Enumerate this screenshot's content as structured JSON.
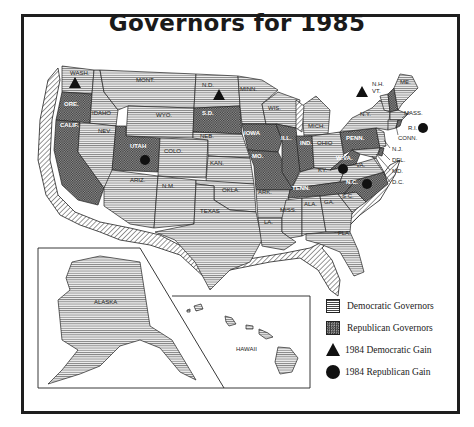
{
  "title": "Governors for 1985",
  "colors": {
    "ink": "#1a1a1a",
    "democratic_fill": "#e8e8e8",
    "republican_fill": "#8a8a8a",
    "coast_hatch": "#555555"
  },
  "states": {
    "wash": "WASH.",
    "ore": "ORE.",
    "calif": "CALIF.",
    "idaho": "IDAHO",
    "nev": "NEV.",
    "mont": "MONT.",
    "wyo": "WYO.",
    "utah": "UTAH",
    "colo": "COLO.",
    "ariz": "ARIZ.",
    "nm": "N.M.",
    "nd": "N.D.",
    "sd": "S.D.",
    "neb": "NEB.",
    "kan": "KAN.",
    "okla": "OKLA.",
    "texas": "TEXAS",
    "minn": "MINN.",
    "iowa": "IOWA",
    "mo": "MO.",
    "ark": "ARK.",
    "la": "LA.",
    "wis": "WIS.",
    "ill": "ILL.",
    "mich": "MICH.",
    "ind": "IND.",
    "ohio": "OHIO",
    "ky": "KY.",
    "tenn": "TENN.",
    "miss": "MISS.",
    "ala": "ALA.",
    "ga": "GA.",
    "fla": "FLA.",
    "sc": "S.C.",
    "nc": "N.C.",
    "va": "VA.",
    "wva": "W.VA.",
    "penn": "PENN.",
    "ny": "N.Y.",
    "vt": "VT.",
    "nh": "N.H.",
    "me": "ME.",
    "mass": "MASS.",
    "ri": "R.I.",
    "conn": "CONN.",
    "nj": "N.J.",
    "del": "DEL.",
    "md": "MD.",
    "dc": "D.C.",
    "alaska": "ALASKA",
    "hawaii": "HAWAII"
  },
  "governor_party": {
    "democratic": [
      "WASH.",
      "CALIF. (hatched coast)",
      "IDAHO",
      "NEV.",
      "MONT.",
      "WYO.",
      "COLO.",
      "ARIZ.",
      "N.M.",
      "N.D.",
      "NEB.",
      "KAN.",
      "OKLA.",
      "TEXAS",
      "MINN.",
      "ARK.",
      "LA.",
      "WIS.",
      "MICH.",
      "OHIO",
      "KY.",
      "MISS.",
      "ALA.",
      "GA.",
      "FLA.",
      "S.C.",
      "VA.",
      "N.Y.",
      "VT.",
      "ME.",
      "MASS.",
      "CONN.",
      "N.J.",
      "MD.",
      "ALASKA",
      "HAWAII"
    ],
    "republican": [
      "ORE.",
      "CALIF.",
      "UTAH",
      "S.D.",
      "IOWA",
      "MO.",
      "ILL.",
      "IND.",
      "TENN.",
      "N.C.",
      "W.VA.",
      "PENN.",
      "N.H.",
      "R.I.",
      "DEL."
    ]
  },
  "gains_1984": {
    "democratic": [
      "WASH.",
      "N.D.",
      "VT."
    ],
    "republican": [
      "UTAH",
      "W.VA.",
      "N.C.",
      "R.I."
    ]
  },
  "legend": [
    {
      "label": "Democratic Governors",
      "symbol": "horizontal-lines-swatch"
    },
    {
      "label": "Republican Governors",
      "symbol": "crosshatch-swatch"
    },
    {
      "label": "1984 Democratic Gain",
      "symbol": "triangle"
    },
    {
      "label": "1984 Republican Gain",
      "symbol": "circle"
    }
  ]
}
